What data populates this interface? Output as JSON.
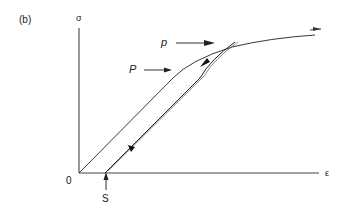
{
  "panel_label": "(b)",
  "axes": {
    "y_label": "σ",
    "x_label": "ε",
    "origin_label": "0"
  },
  "points": {
    "P_upper": "p",
    "P_lower": "P",
    "S": "S"
  },
  "colors": {
    "line": "#222222",
    "background": "#ffffff"
  }
}
